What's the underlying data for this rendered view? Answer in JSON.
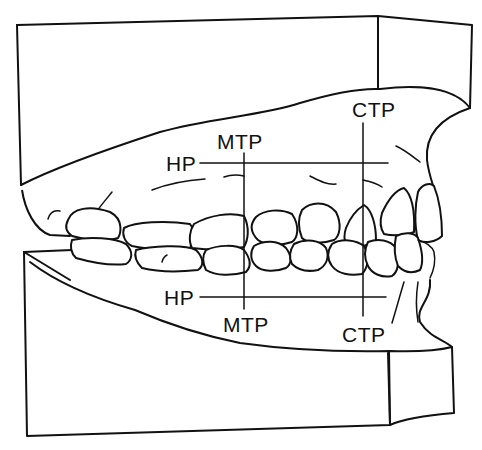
{
  "figure": {
    "labels": {
      "upper_ctp": "CTP",
      "upper_mtp": "MTP",
      "upper_hp": "HP",
      "lower_hp": "HP",
      "lower_mtp": "MTP",
      "lower_ctp": "CTP"
    },
    "reference_lines": [
      {
        "id": "HP-upper",
        "type": "horizontal",
        "y": 163,
        "x_from": 200,
        "x_to": 388
      },
      {
        "id": "HP-lower",
        "type": "horizontal",
        "y": 297,
        "x_from": 200,
        "x_to": 386
      },
      {
        "id": "MTP",
        "type": "vertical",
        "x": 244,
        "y_from": 153,
        "y_to": 309
      },
      {
        "id": "CTP",
        "type": "vertical",
        "x": 363,
        "y_from": 123,
        "y_to": 316
      }
    ],
    "colors": {
      "ink": "#111111",
      "paper": "#ffffff"
    }
  }
}
